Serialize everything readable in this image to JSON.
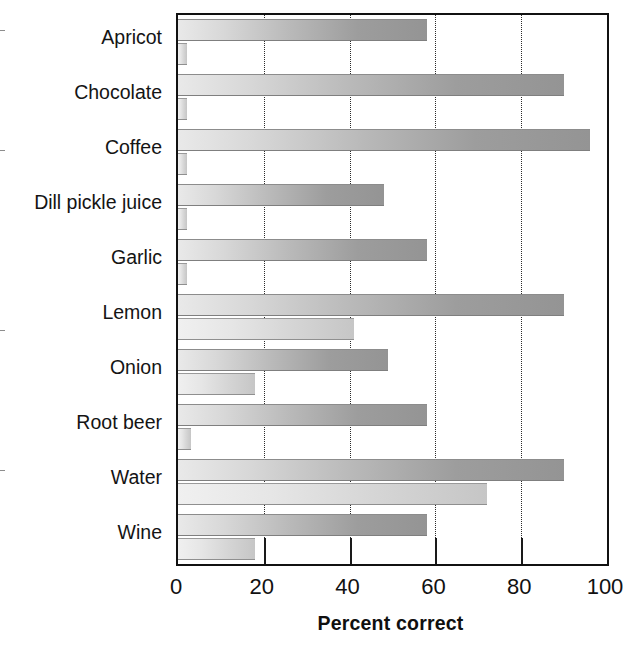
{
  "chart_data": {
    "type": "bar",
    "orientation": "horizontal",
    "title": "",
    "xlabel": "Percent correct",
    "ylabel": "",
    "xlim": [
      0,
      100
    ],
    "xticks": [
      0,
      20,
      40,
      60,
      80,
      100
    ],
    "xtick_labels": [
      "0",
      "20",
      "40",
      "60",
      "80",
      "100"
    ],
    "grid": "vertical-dotted",
    "legend": "none",
    "categories": [
      "Apricot",
      "Chocolate",
      "Coffee",
      "Dill pickle juice",
      "Garlic",
      "Lemon",
      "Onion",
      "Root beer",
      "Water",
      "Wine"
    ],
    "series": [
      {
        "name": "upper-bar",
        "color": "#9d9d9d",
        "values": [
          58,
          90,
          96,
          48,
          58,
          90,
          49,
          58,
          90,
          58
        ]
      },
      {
        "name": "lower-bar",
        "color": "#d8d8d8",
        "values": [
          2,
          2,
          2,
          2,
          2,
          41,
          18,
          3,
          72,
          18
        ]
      }
    ]
  },
  "axis": {
    "x_title": "Percent correct"
  }
}
